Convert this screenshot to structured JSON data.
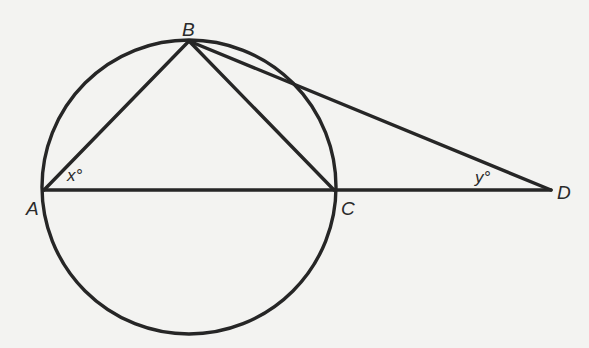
{
  "figure": {
    "points": {
      "A": {
        "label": "A",
        "x": 44,
        "y": 190
      },
      "B": {
        "label": "B",
        "x": 189,
        "y": 41
      },
      "C": {
        "label": "C",
        "x": 334,
        "y": 190
      },
      "D": {
        "label": "D",
        "x": 551,
        "y": 190
      }
    },
    "circle": {
      "cx": 189,
      "cy": 187,
      "r": 147
    },
    "segments": [
      {
        "from": "A",
        "to": "B"
      },
      {
        "from": "B",
        "to": "C"
      },
      {
        "from": "B",
        "to": "D"
      },
      {
        "from": "A",
        "to": "D"
      }
    ],
    "angles": {
      "x": {
        "label": "x°",
        "vertex": "A"
      },
      "y": {
        "label": "y°",
        "vertex": "D"
      }
    },
    "colors": {
      "ink": "#262626",
      "paper": "#f3f3f1"
    }
  }
}
